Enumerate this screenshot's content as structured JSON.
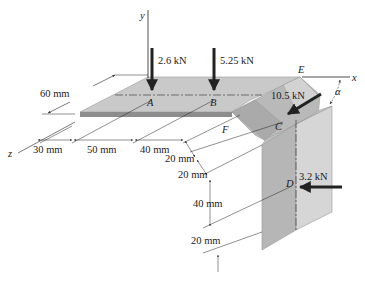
{
  "figure": {
    "type": "engineering statics diagram",
    "axes": {
      "x": "x",
      "y": "y",
      "z": "z"
    },
    "points": [
      "A",
      "B",
      "C",
      "D",
      "E",
      "F"
    ],
    "angle_label": "α",
    "forces": [
      {
        "point": "A",
        "label": "2.6 kN",
        "direction": "down (-y)"
      },
      {
        "point": "B",
        "label": "5.25 kN",
        "direction": "down (-y)"
      },
      {
        "point": "C",
        "label": "10.5 kN",
        "direction": "along inclined face at angle α"
      },
      {
        "point": "D",
        "label": "3.2 kN",
        "direction": "horizontal (-x)"
      }
    ],
    "dimensions": {
      "width": "60 mm",
      "z_segments": [
        "30 mm",
        "50 mm",
        "40 mm"
      ],
      "diag_segments": [
        "20 mm",
        "20 mm"
      ],
      "vertical_segments": [
        "40 mm",
        "20 mm"
      ]
    },
    "colors": {
      "plate_top": "#c8c8c8",
      "plate_edge": "#8c8c8c",
      "slope_face": "#bcbcbc",
      "vertical_front": "#b4b4b4",
      "vertical_side": "#d4d4d4",
      "arrow": "#222222"
    }
  }
}
